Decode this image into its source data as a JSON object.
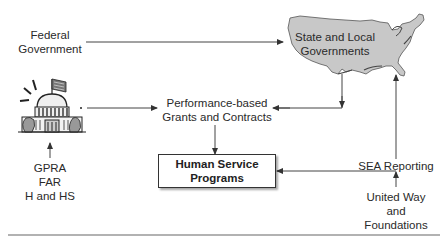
{
  "diagram": {
    "nodes": {
      "federal": {
        "line1": "Federal",
        "line2": "Government"
      },
      "state_local": {
        "line1": "State and Local",
        "line2": "Governments",
        "icon": "us-map-icon",
        "fill": "#c8c8c8"
      },
      "capitol": {
        "icon": "capitol-building-icon"
      },
      "performance": {
        "line1": "Performance-based",
        "line2": "Grants and Contracts"
      },
      "programs": {
        "line1": "Human Service",
        "line2": "Programs"
      },
      "regulations": {
        "line1": "GPRA",
        "line2": "FAR",
        "line3": "H and HS"
      },
      "sea": {
        "label": "SEA Reporting"
      },
      "united_way": {
        "line1": "United Way",
        "line2": "and",
        "line3": "Foundations"
      }
    },
    "edges": [
      {
        "from": "Federal Government",
        "to": "State and Local Governments"
      },
      {
        "from": "Capitol",
        "to": "Performance-based Grants and Contracts"
      },
      {
        "from": "State and Local Governments",
        "to": "Performance-based Grants and Contracts"
      },
      {
        "from": "Performance-based Grants and Contracts",
        "to": "Human Service Programs"
      },
      {
        "from": "GPRA / FAR / H and HS",
        "to": "Capitol"
      },
      {
        "from": "SEA Reporting",
        "to": "State and Local Governments"
      },
      {
        "from": "United Way and Foundations",
        "to": "Human Service Programs"
      }
    ],
    "colors": {
      "line": "#444444",
      "map_fill": "#c8c8c8",
      "text": "#2a2a2a"
    }
  }
}
